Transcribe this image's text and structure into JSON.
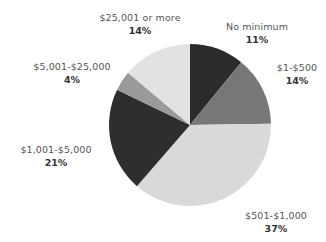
{
  "chart_data": {
    "type": "pie",
    "title": "",
    "start_angle": "12 o'clock",
    "direction": "clockwise",
    "slices": [
      {
        "label": "No minimum",
        "value": 11,
        "value_label": "11%",
        "color": "#2b2b2b"
      },
      {
        "label": "$1-$500",
        "value": 14,
        "value_label": "14%",
        "color": "#777777"
      },
      {
        "label": "$501-$1,000",
        "value": 37,
        "value_label": "37%",
        "color": "#d9d9d9"
      },
      {
        "label": "$1,001-$5,000",
        "value": 21,
        "value_label": "21%",
        "color": "#2e2e2e"
      },
      {
        "label": "$5,001-$25,000",
        "value": 4,
        "value_label": "4%",
        "color": "#9a9a9a"
      },
      {
        "label": "$25,001 or more",
        "value": 14,
        "value_label": "14%",
        "color": "#e2e2e2"
      }
    ],
    "categories": [
      "No minimum",
      "$1-$500",
      "$501-$1,000",
      "$1,001-$5,000",
      "$5,001-$25,000",
      "$25,001 or more"
    ],
    "values": [
      11,
      14,
      37,
      21,
      4,
      14
    ],
    "legend": "none (direct labels)"
  },
  "labels": [
    {
      "name": "No minimum",
      "pct": "11%"
    },
    {
      "name": "$1-$500",
      "pct": "14%"
    },
    {
      "name": "$501-$1,000",
      "pct": "37%"
    },
    {
      "name": "$1,001-$5,000",
      "pct": "21%"
    },
    {
      "name": "$5,001-$25,000",
      "pct": "4%"
    },
    {
      "name": "$25,001 or more",
      "pct": "14%"
    }
  ]
}
